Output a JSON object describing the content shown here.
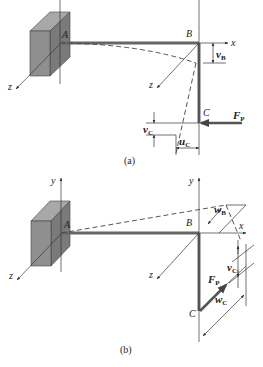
{
  "figure_a": {
    "caption": "(a)",
    "points": {
      "A": "A",
      "B": "B",
      "C": "C"
    },
    "axes": {
      "x": "x",
      "y": "y",
      "z_support": "z",
      "z_B": "z"
    },
    "displacements": {
      "vB": {
        "main": "v",
        "sub": "B"
      },
      "vC": {
        "main": "v",
        "sub": "C"
      },
      "uC": {
        "main": "u",
        "sub": "C"
      }
    },
    "force": {
      "main": "F",
      "sub": "P"
    }
  },
  "figure_b": {
    "caption": "(b)",
    "points": {
      "A": "A",
      "B": "B",
      "C": "C"
    },
    "axes": {
      "x": "x",
      "y": "y",
      "y2": "y",
      "z_support": "z",
      "z_B": "z"
    },
    "displacements": {
      "wB": {
        "main": "w",
        "sub": "B"
      },
      "vC": {
        "main": "v",
        "sub": "C"
      },
      "wC": {
        "main": "w",
        "sub": "C"
      }
    },
    "force": {
      "main": "F",
      "sub": "P"
    }
  },
  "colors": {
    "beam": "#666666",
    "block": "#8c8c8c",
    "line": "#333333"
  }
}
